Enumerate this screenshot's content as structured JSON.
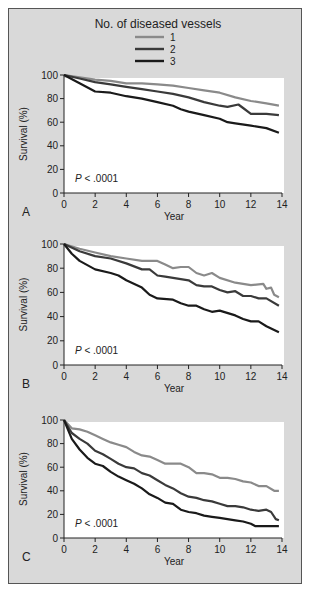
{
  "legend": {
    "title": "No. of diseased vessels",
    "entries": [
      {
        "label": "1",
        "color": "#8a8a8a"
      },
      {
        "label": "2",
        "color": "#3a3a3a"
      },
      {
        "label": "3",
        "color": "#1a1a1a"
      }
    ]
  },
  "chart_data": [
    {
      "type": "line",
      "panel_label": "A",
      "annotation": "P < .0001",
      "xlabel": "Year",
      "ylabel": "Survival (%)",
      "xlim": [
        0,
        14
      ],
      "ylim": [
        0,
        100
      ],
      "xticks": [
        0,
        2,
        4,
        6,
        8,
        10,
        12,
        14
      ],
      "yticks": [
        0,
        20,
        40,
        60,
        80,
        100
      ],
      "grid": false,
      "series": [
        {
          "name": "1",
          "x": [
            0,
            1,
            2,
            3,
            4,
            5,
            6,
            7,
            8,
            9,
            10,
            11,
            12,
            13,
            13.8
          ],
          "y": [
            100,
            98,
            96,
            95,
            93,
            93,
            92,
            91,
            89,
            87,
            85,
            81,
            78,
            76,
            74
          ]
        },
        {
          "name": "2",
          "x": [
            0,
            1,
            2,
            3,
            4,
            5,
            6,
            7,
            8,
            9,
            10,
            10.5,
            11.2,
            11.5,
            12,
            13,
            13.8
          ],
          "y": [
            100,
            97,
            94,
            92,
            90,
            88,
            86,
            84,
            81,
            77,
            74,
            73,
            75,
            72,
            67,
            67,
            66
          ]
        },
        {
          "name": "3",
          "x": [
            0,
            1,
            2,
            3,
            4,
            5,
            6,
            7,
            7.5,
            8,
            9,
            10,
            10.5,
            11,
            12,
            13,
            13.8
          ],
          "y": [
            100,
            93,
            86,
            85,
            82,
            80,
            77,
            74,
            71,
            69,
            66,
            63,
            60,
            59,
            57,
            55,
            51
          ]
        }
      ]
    },
    {
      "type": "line",
      "panel_label": "B",
      "annotation": "P < .0001",
      "xlabel": "Year",
      "ylabel": "Survival (%)",
      "xlim": [
        0,
        14
      ],
      "ylim": [
        0,
        100
      ],
      "xticks": [
        0,
        2,
        4,
        6,
        8,
        10,
        12,
        14
      ],
      "yticks": [
        0,
        20,
        40,
        60,
        80,
        100
      ],
      "grid": false,
      "series": [
        {
          "name": "1",
          "x": [
            0,
            1,
            2,
            3,
            4,
            5,
            6,
            6.5,
            7,
            7.5,
            8,
            8.5,
            9,
            9.5,
            10,
            11,
            12,
            12.8,
            13,
            13.3,
            13.5,
            13.8
          ],
          "y": [
            100,
            96,
            93,
            90,
            88,
            86,
            86,
            83,
            80,
            81,
            81,
            76,
            74,
            76,
            72,
            68,
            66,
            67,
            63,
            64,
            58,
            56
          ]
        },
        {
          "name": "2",
          "x": [
            0,
            1,
            2,
            3,
            4,
            5,
            5.5,
            6,
            6.5,
            7,
            8,
            8.5,
            9,
            9.5,
            10,
            10.5,
            11,
            11.5,
            12,
            12.5,
            13,
            13.8
          ],
          "y": [
            100,
            94,
            90,
            88,
            84,
            79,
            79,
            74,
            73,
            72,
            70,
            66,
            65,
            65,
            62,
            60,
            61,
            57,
            57,
            55,
            55,
            49
          ]
        },
        {
          "name": "3",
          "x": [
            0,
            0.5,
            1,
            2,
            3,
            3.5,
            4,
            5,
            5.5,
            6,
            7,
            7.5,
            8,
            8.5,
            9,
            9.5,
            10,
            11,
            11.5,
            12,
            12.5,
            13,
            13.8
          ],
          "y": [
            100,
            92,
            86,
            79,
            76,
            74,
            70,
            64,
            58,
            55,
            54,
            51,
            49,
            49,
            46,
            44,
            45,
            41,
            38,
            36,
            36,
            32,
            27
          ]
        }
      ]
    },
    {
      "type": "line",
      "panel_label": "C",
      "annotation": "P < .0001",
      "xlabel": "Year",
      "ylabel": "Survival (%)",
      "xlim": [
        0,
        14
      ],
      "ylim": [
        0,
        100
      ],
      "xticks": [
        0,
        2,
        4,
        6,
        8,
        10,
        12,
        14
      ],
      "yticks": [
        0,
        20,
        40,
        60,
        80,
        100
      ],
      "grid": false,
      "series": [
        {
          "name": "1",
          "x": [
            0,
            0.5,
            1,
            1.5,
            2,
            2.5,
            3,
            3.5,
            4,
            4.5,
            5,
            5.5,
            6,
            6.5,
            7,
            7.5,
            8,
            8.5,
            9,
            9.5,
            10,
            10.5,
            11,
            11.5,
            12,
            12.5,
            13,
            13.5,
            13.8
          ],
          "y": [
            100,
            93,
            92,
            90,
            87,
            84,
            81,
            79,
            77,
            73,
            70,
            69,
            66,
            63,
            63,
            63,
            60,
            55,
            55,
            54,
            51,
            51,
            50,
            48,
            47,
            44,
            44,
            40,
            40
          ]
        },
        {
          "name": "2",
          "x": [
            0,
            0.5,
            1,
            1.5,
            2,
            2.5,
            3,
            3.5,
            4,
            4.5,
            5,
            5.5,
            6,
            6.5,
            7,
            7.5,
            8,
            8.5,
            9,
            9.5,
            10,
            10.5,
            11,
            11.5,
            12,
            12.5,
            13,
            13.3,
            13.6,
            13.8
          ],
          "y": [
            100,
            89,
            84,
            80,
            74,
            71,
            67,
            63,
            60,
            59,
            55,
            53,
            49,
            45,
            42,
            38,
            35,
            34,
            32,
            31,
            29,
            27,
            27,
            26,
            24,
            23,
            24,
            22,
            16,
            15
          ]
        },
        {
          "name": "3",
          "x": [
            0,
            0.5,
            1,
            1.5,
            2,
            2.5,
            3,
            3.5,
            4,
            4.5,
            5,
            5.5,
            6,
            6.5,
            7,
            7.5,
            8,
            8.5,
            9,
            9.5,
            10,
            10.5,
            11,
            11.5,
            12,
            12.3,
            12.5,
            13,
            13.8
          ],
          "y": [
            100,
            84,
            75,
            68,
            63,
            61,
            56,
            52,
            49,
            46,
            42,
            37,
            34,
            30,
            29,
            24,
            22,
            21,
            19,
            18,
            17,
            16,
            15,
            14,
            12,
            10,
            10,
            10,
            10
          ]
        }
      ]
    }
  ]
}
